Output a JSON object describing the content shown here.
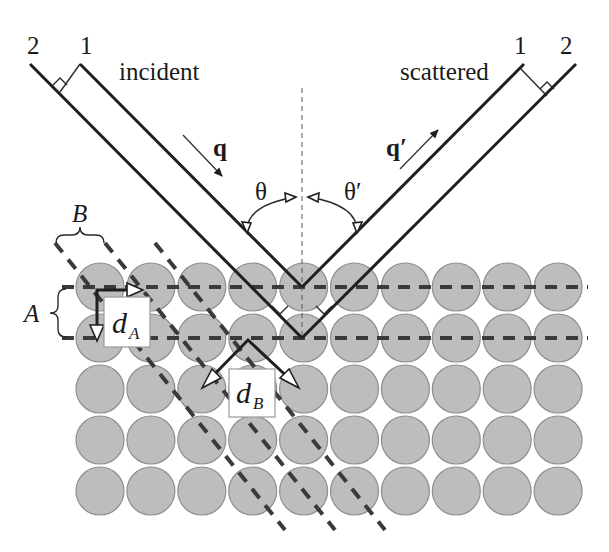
{
  "labels": {
    "incident": "incident",
    "scattered": "scattered",
    "ray1_left": "1",
    "ray2_left": "2",
    "ray1_right": "1",
    "ray2_right": "2",
    "q": "q",
    "q_prime": "q′",
    "theta": "θ",
    "theta_prime": "θ′",
    "plane_family_A": "A",
    "plane_family_B": "B",
    "d_A": "d",
    "d_A_sub": "A",
    "d_B": "d",
    "d_B_sub": "B"
  },
  "lattice": {
    "rows": 5,
    "columns": 10,
    "atom_color": "#bdbdbd",
    "atom_stroke": "#8f8f8f"
  },
  "colors": {
    "beam": "#1f1f1f",
    "plane_dash": "#3a3a3a",
    "background": "#ffffff"
  }
}
